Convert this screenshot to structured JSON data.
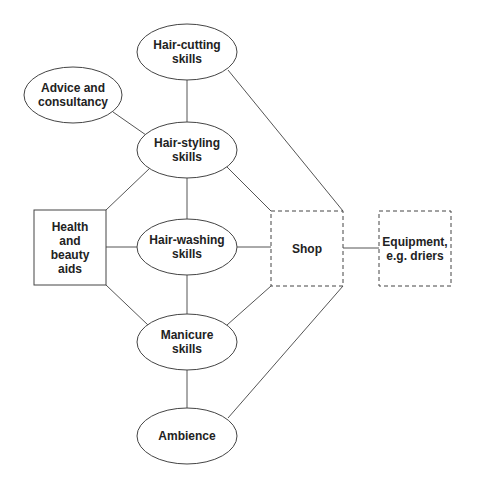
{
  "diagram": {
    "colors": {
      "stroke": "#444444",
      "edge": "#555555",
      "text": "#222222",
      "background": "#ffffff"
    },
    "nodes": [
      {
        "id": "hair-cutting",
        "label": "Hair-cutting\nskills",
        "shape": "ellipse",
        "border": "solid"
      },
      {
        "id": "advice",
        "label": "Advice and\nconsultancy",
        "shape": "ellipse",
        "border": "solid"
      },
      {
        "id": "hair-styling",
        "label": "Hair-styling\nskills",
        "shape": "ellipse",
        "border": "solid"
      },
      {
        "id": "health",
        "label": "Health\nand\nbeauty\naids",
        "shape": "rectangle",
        "border": "solid"
      },
      {
        "id": "hair-washing",
        "label": "Hair-washing\nskills",
        "shape": "ellipse",
        "border": "solid"
      },
      {
        "id": "shop",
        "label": "Shop",
        "shape": "rectangle",
        "border": "dashed"
      },
      {
        "id": "equipment",
        "label": "Equipment,\ne.g. driers",
        "shape": "rectangle",
        "border": "dashed"
      },
      {
        "id": "manicure",
        "label": "Manicure\nskills",
        "shape": "ellipse",
        "border": "solid"
      },
      {
        "id": "ambience",
        "label": "Ambience",
        "shape": "ellipse",
        "border": "solid"
      }
    ],
    "edges": [
      [
        "hair-cutting",
        "hair-styling"
      ],
      [
        "hair-cutting",
        "shop"
      ],
      [
        "advice",
        "hair-styling"
      ],
      [
        "hair-styling",
        "health"
      ],
      [
        "hair-styling",
        "hair-washing"
      ],
      [
        "hair-styling",
        "shop"
      ],
      [
        "health",
        "hair-washing"
      ],
      [
        "hair-washing",
        "shop"
      ],
      [
        "health",
        "manicure"
      ],
      [
        "hair-washing",
        "manicure"
      ],
      [
        "manicure",
        "shop"
      ],
      [
        "manicure",
        "ambience"
      ],
      [
        "ambience",
        "shop"
      ],
      [
        "shop",
        "equipment"
      ]
    ]
  }
}
